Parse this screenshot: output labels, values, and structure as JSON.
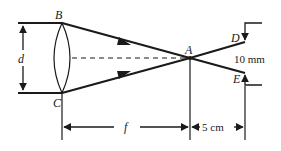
{
  "diagram": {
    "points": {
      "B": "B",
      "C": "C",
      "A": "A",
      "D": "D",
      "E": "E"
    },
    "labels": {
      "aperture": "d",
      "focal_length": "f",
      "screen_distance": "5 cm",
      "spot_size": "10 mm"
    },
    "colors": {
      "stroke": "#1a1a1a",
      "background": "#ffffff"
    }
  }
}
